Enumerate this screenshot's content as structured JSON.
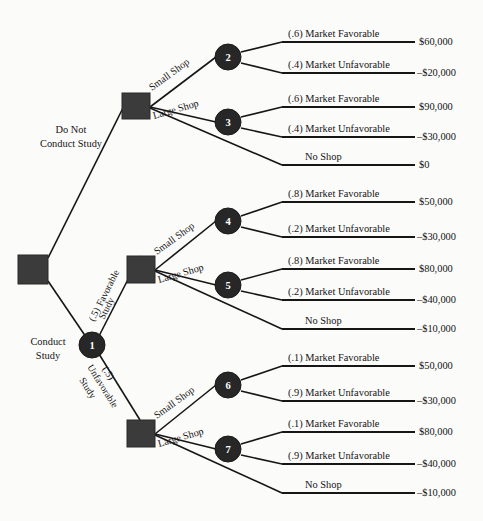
{
  "diagram": {
    "background_color": "#fbfbfa",
    "node_fill": "#272727",
    "square_fill": "#3b3b3b",
    "line_color": "#161616"
  },
  "root": {
    "no_study_label_line1": "Do Not",
    "no_study_label_line2": "Conduct Study",
    "study_label_line1": "Conduct",
    "study_label_line2": "Study"
  },
  "study_branches": {
    "favorable_prob": "(.5)",
    "favorable_line1": "Favorable",
    "favorable_line2": "Study",
    "unfavorable_prob": "(.5)",
    "unfavorable_line1": "Unfavorable",
    "unfavorable_line2": "Study"
  },
  "shop_labels": {
    "small": "Small Shop",
    "large": "Large Shop",
    "none": "No Shop"
  },
  "nodes": [
    {
      "id": "1",
      "type": "chance",
      "label": "1"
    },
    {
      "id": "2",
      "type": "chance",
      "label": "2"
    },
    {
      "id": "3",
      "type": "chance",
      "label": "3"
    },
    {
      "id": "4",
      "type": "chance",
      "label": "4"
    },
    {
      "id": "5",
      "type": "chance",
      "label": "5"
    },
    {
      "id": "6",
      "type": "chance",
      "label": "6"
    },
    {
      "id": "7",
      "type": "chance",
      "label": "7"
    }
  ],
  "outcomes": [
    {
      "key": "o1",
      "group": "no-study",
      "node": "2",
      "label": "(.6) Market Favorable",
      "payoff": "$60,000"
    },
    {
      "key": "o2",
      "group": "no-study",
      "node": "2",
      "label": "(.4) Market Unfavorable",
      "payoff": "–$20,000"
    },
    {
      "key": "o3",
      "group": "no-study",
      "node": "3",
      "label": "(.6) Market Favorable",
      "payoff": "$90,000"
    },
    {
      "key": "o4",
      "group": "no-study",
      "node": "3",
      "label": "(.4) Market Unfavorable",
      "payoff": "–$30,000"
    },
    {
      "key": "o5",
      "group": "no-study",
      "node": "",
      "label": "No Shop",
      "payoff": "$0"
    },
    {
      "key": "o6",
      "group": "favorable-study",
      "node": "4",
      "label": "(.8) Market Favorable",
      "payoff": "$50,000"
    },
    {
      "key": "o7",
      "group": "favorable-study",
      "node": "4",
      "label": "(.2) Market Unfavorable",
      "payoff": "–$30,000"
    },
    {
      "key": "o8",
      "group": "favorable-study",
      "node": "5",
      "label": "(.8) Market Favorable",
      "payoff": "$80,000"
    },
    {
      "key": "o9",
      "group": "favorable-study",
      "node": "5",
      "label": "(.2) Market Unfavorable",
      "payoff": "–$40,000"
    },
    {
      "key": "o10",
      "group": "favorable-study",
      "node": "",
      "label": "No Shop",
      "payoff": "–$10,000"
    },
    {
      "key": "o11",
      "group": "unfavorable-study",
      "node": "6",
      "label": "(.1) Market Favorable",
      "payoff": "$50,000"
    },
    {
      "key": "o12",
      "group": "unfavorable-study",
      "node": "6",
      "label": "(.9) Market Unfavorable",
      "payoff": "–$30,000"
    },
    {
      "key": "o13",
      "group": "unfavorable-study",
      "node": "7",
      "label": "(.1) Market Favorable",
      "payoff": "$80,000"
    },
    {
      "key": "o14",
      "group": "unfavorable-study",
      "node": "7",
      "label": "(.9) Market Unfavorable",
      "payoff": "–$40,000"
    },
    {
      "key": "o15",
      "group": "unfavorable-study",
      "node": "",
      "label": "No Shop",
      "payoff": "–$10,000"
    }
  ]
}
